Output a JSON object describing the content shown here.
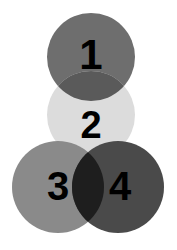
{
  "canvas": {
    "width": 177,
    "height": 250,
    "background_color": "#ffffff"
  },
  "diagram": {
    "type": "overlapping-circles",
    "arrangement": "pyramid",
    "circle_count": 4,
    "label_color": "#000000",
    "circles": [
      {
        "id": "circle-1",
        "label": "1",
        "cx": 91,
        "cy": 57,
        "r": 44,
        "fill": "#6e6e6e",
        "label_x": 91,
        "label_y": 58,
        "label_size": 42
      },
      {
        "id": "circle-2",
        "label": "2",
        "cx": 91,
        "cy": 115,
        "r": 44,
        "fill": "#dcdcdc",
        "label_x": 91,
        "label_y": 128,
        "label_size": 38
      },
      {
        "id": "circle-3",
        "label": "3",
        "cx": 58,
        "cy": 187,
        "r": 46,
        "fill": "#8a8a8a",
        "label_x": 58,
        "label_y": 189,
        "label_size": 40
      },
      {
        "id": "circle-4",
        "label": "4",
        "cx": 118,
        "cy": 187,
        "r": 46,
        "fill": "#4a4a4a",
        "label_x": 120,
        "label_y": 189,
        "label_size": 40
      }
    ],
    "intersections": [
      {
        "id": "intersection-1-2",
        "between": "1 and 2",
        "fill": "#5a5a5a",
        "circle_a": 0,
        "circle_b": 1
      },
      {
        "id": "intersection-3-4",
        "between": "3 and 4",
        "fill": "#1e1e1e",
        "circle_a": 2,
        "circle_b": 3
      }
    ]
  }
}
